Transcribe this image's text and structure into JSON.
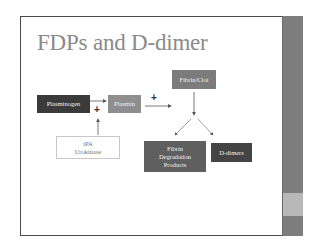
{
  "slide": {
    "title": "FDPs and D-dimer",
    "accent_colors": {
      "sidebar": "#7d7d7d",
      "sidebar_band": "#b8b8b8",
      "title_text": "#8a8a8a"
    }
  },
  "diagram": {
    "nodes": {
      "plasminogen": "Plasminogen",
      "plasmin": "Plasmin",
      "fibrin_clot": "Fibrin/Clot",
      "tpa_line1": "tPA",
      "tpa_line2": "Urokinase",
      "fdp_line1": "Fibrin",
      "fdp_line2": "Degradation",
      "fdp_line3": "Products",
      "ddimers": "D-dimers"
    },
    "operators": {
      "plus_activator": "+",
      "plus_plasmin": "+"
    },
    "edges": [
      {
        "from": "Plasminogen",
        "to": "Plasmin"
      },
      {
        "from": "tPA/Urokinase",
        "to": "Plasminogen→Plasmin",
        "label": "+"
      },
      {
        "from": "Plasmin",
        "to": "Fibrin/Clot",
        "label": "+"
      },
      {
        "from": "Fibrin/Clot",
        "to": "Fibrin Degradation Products"
      },
      {
        "from": "Fibrin/Clot",
        "to": "D-dimers"
      }
    ]
  }
}
